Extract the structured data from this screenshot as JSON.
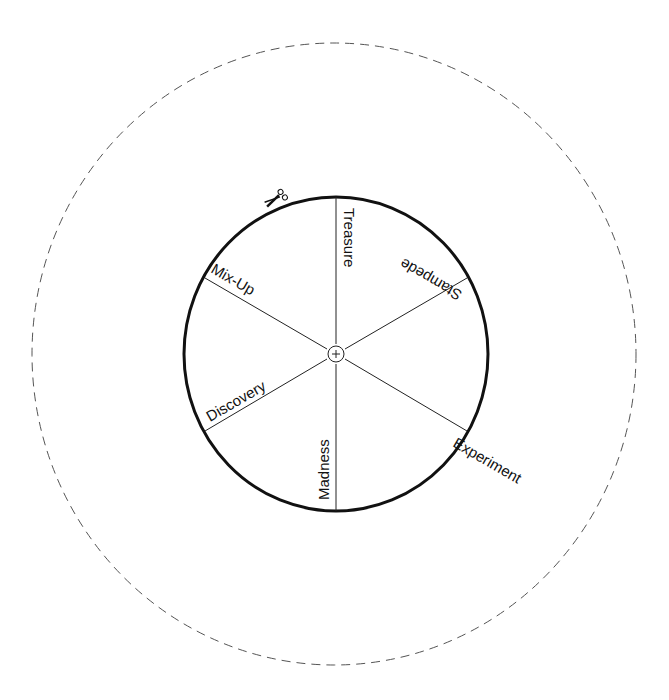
{
  "wheel": {
    "center": [
      336,
      354
    ],
    "outer_guide": {
      "rx": 302,
      "ry": 311,
      "style": "dashed",
      "color": "#555555"
    },
    "inner_wheel": {
      "rx": 152,
      "ry": 157,
      "stroke": "#111111"
    },
    "hub_icon": "crosshair-circle-icon",
    "cut_icon": "scissors-icon",
    "segments": [
      {
        "label": "Treasure"
      },
      {
        "label": "Stampede"
      },
      {
        "label": "Experiment"
      },
      {
        "label": "Madness"
      },
      {
        "label": "Discovery"
      },
      {
        "label": "Mix-Up"
      }
    ]
  }
}
